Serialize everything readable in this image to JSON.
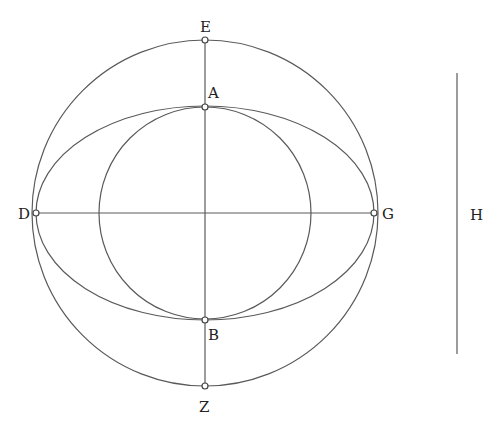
{
  "diagram": {
    "type": "geometric-construction",
    "center": [
      205,
      213
    ],
    "outer_circle": {
      "r": 173
    },
    "inner_circle": {
      "r": 106
    },
    "ellipse": {
      "rx": 169,
      "ry": 107
    },
    "points": {
      "E": {
        "label": "E",
        "x": 205,
        "y": 40
      },
      "A": {
        "label": "A",
        "x": 205,
        "y": 107
      },
      "D": {
        "label": "D",
        "x": 36,
        "y": 213
      },
      "G": {
        "label": "G",
        "x": 374,
        "y": 213
      },
      "B": {
        "label": "B",
        "x": 205,
        "y": 320
      },
      "Z": {
        "label": "Z",
        "x": 205,
        "y": 386
      }
    },
    "segment_H": {
      "label": "H",
      "x": 457,
      "y1": 73,
      "y2": 354
    },
    "colors": {
      "stroke": "#5a5a5a",
      "text": "#222222",
      "background": "#ffffff"
    }
  }
}
